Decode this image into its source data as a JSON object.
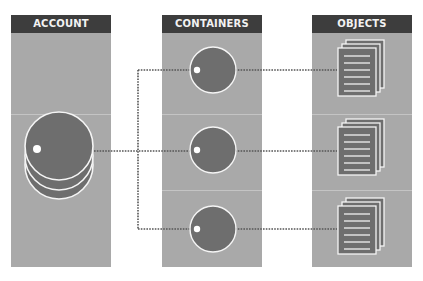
{
  "diagram": {
    "columns": [
      {
        "id": "account",
        "label": "ACCOUNT"
      },
      {
        "id": "containers",
        "label": "CONTAINERS"
      },
      {
        "id": "objects",
        "label": "OBJECTS"
      }
    ],
    "nodes": {
      "account": {
        "shape": "stacked-disks",
        "count": 3
      },
      "containers": [
        {
          "shape": "disk",
          "row": 1
        },
        {
          "shape": "disk",
          "row": 2
        },
        {
          "shape": "disk",
          "row": 3
        }
      ],
      "objects": [
        {
          "shape": "document-stack",
          "row": 1
        },
        {
          "shape": "document-stack",
          "row": 2
        },
        {
          "shape": "document-stack",
          "row": 3
        }
      ]
    },
    "connectors": [
      {
        "from": "account",
        "to": "containers.1",
        "style": "dotted"
      },
      {
        "from": "account",
        "to": "containers.2",
        "style": "dotted"
      },
      {
        "from": "account",
        "to": "containers.3",
        "style": "dotted"
      },
      {
        "from": "containers.1",
        "to": "objects.1",
        "style": "dotted"
      },
      {
        "from": "containers.2",
        "to": "objects.2",
        "style": "dotted"
      },
      {
        "from": "containers.3",
        "to": "objects.3",
        "style": "dotted"
      }
    ],
    "colors": {
      "panel": "#a9a9a9",
      "header": "#3d3d3d",
      "header_text": "#f2f2f2",
      "disk": "#6e6e6e",
      "outline": "#f5f5f5",
      "connector": "#555555"
    }
  }
}
